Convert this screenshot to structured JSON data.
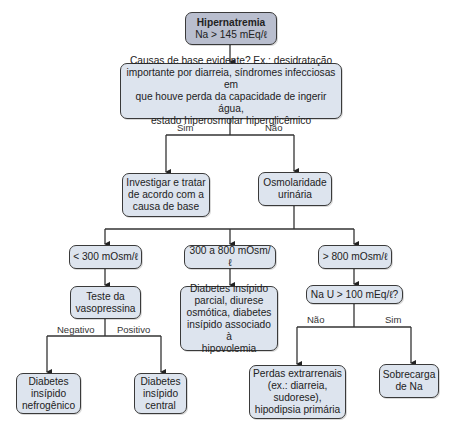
{
  "diagram": {
    "type": "flowchart",
    "colors": {
      "node_fill": "#dde4ee",
      "root_fill": "#b9bece",
      "border": "#3a3a3a",
      "line": "#333333"
    },
    "nodes": {
      "root_title": "Hipernatremia",
      "root_sub": "Na > 145 mEq/ℓ",
      "causes": "Causas de base evidente? Ex.: desidratação\nimportante por diarreia, síndromes infecciosas em\nque houve perda da capacidade de ingerir água,\nestado hiperosmolar hiperglicêmico",
      "investigate": "Investigar e tratar\nde acordo com a\ncausa de base",
      "osmolality": "Osmolaridade\nurinária",
      "low": "< 300 mOsm/ℓ",
      "mid": "300 a 800 mOsm/ℓ",
      "high": "> 800 mOsm/ℓ",
      "vasopressin": "Teste da\nvasopressina",
      "partial": "Diabetes insípido\nparcial, diurese\nosmótica, diabetes\ninsípido associado à\nhipovolemia",
      "nau": "Na U > 100 mEq/ℓ?",
      "nephrogenic": "Diabetes\ninsípido\nnefrogênico",
      "central": "Diabetes\ninsípido\ncentral",
      "extrarenal": "Perdas extrarrenais\n(ex.: diarreia,\nsudorese),\nhipodipsia primária",
      "overload": "Sobrecarga\nde Na"
    },
    "edge_labels": {
      "causes_yes": "Sim",
      "causes_no": "Não",
      "vaso_neg": "Negativo",
      "vaso_pos": "Positivo",
      "nau_no": "Não",
      "nau_yes": "Sim"
    }
  }
}
